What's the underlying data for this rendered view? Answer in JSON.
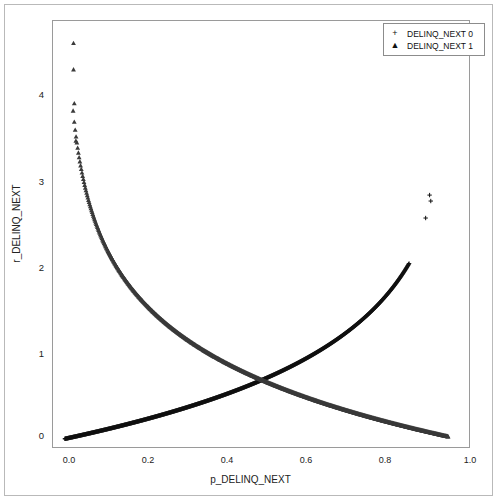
{
  "figure": {
    "background_color": "#ffffff",
    "frame_color": "#9a9a9a"
  },
  "axes": {
    "xlabel": "p_DELINQ_NEXT",
    "ylabel": "r_DELINQ_NEXT",
    "xticks": [
      "0.0",
      "0.2",
      "0.4",
      "0.6",
      "0.8",
      "1.0"
    ],
    "xtick_values": [
      0.0,
      0.2,
      0.4,
      0.6,
      0.8,
      1.0
    ],
    "yticks": [
      "0",
      "1",
      "2",
      "3",
      "4"
    ],
    "ytick_values": [
      0,
      1,
      2,
      3,
      4
    ],
    "xlim": [
      -0.03,
      1.03
    ],
    "ylim": [
      -0.12,
      4.92
    ],
    "grid": false
  },
  "legend": {
    "position": "upper-right",
    "entries": [
      {
        "marker": "+",
        "marker_name": "plus-marker",
        "label": "DELINQ_NEXT 0",
        "color": "#111111"
      },
      {
        "marker": "▲",
        "marker_name": "triangle-marker",
        "label": "DELINQ_NEXT 1",
        "color": "#333333"
      }
    ]
  },
  "chart_data": {
    "type": "scatter",
    "title": "",
    "xlabel": "p_DELINQ_NEXT",
    "ylabel": "r_DELINQ_NEXT",
    "xlim": [
      -0.03,
      1.03
    ],
    "ylim": [
      -0.12,
      4.92
    ],
    "grid": false,
    "series": [
      {
        "name": "DELINQ_NEXT 0",
        "marker": "plus",
        "color": "#111111",
        "curve": "negative-log-one-minus-p",
        "p_range": [
          0.0,
          0.873
        ],
        "n_points": 900,
        "endpoints": [
          [
            0.0,
            0.0
          ],
          [
            0.873,
            2.06
          ]
        ],
        "sample_points": [
          [
            0.0,
            0.0
          ],
          [
            0.05,
            0.051
          ],
          [
            0.1,
            0.105
          ],
          [
            0.15,
            0.163
          ],
          [
            0.2,
            0.223
          ],
          [
            0.25,
            0.288
          ],
          [
            0.3,
            0.357
          ],
          [
            0.35,
            0.431
          ],
          [
            0.4,
            0.511
          ],
          [
            0.45,
            0.598
          ],
          [
            0.5,
            0.693
          ],
          [
            0.55,
            0.799
          ],
          [
            0.6,
            0.916
          ],
          [
            0.65,
            1.05
          ],
          [
            0.7,
            1.2
          ],
          [
            0.75,
            1.39
          ],
          [
            0.8,
            1.61
          ],
          [
            0.85,
            1.9
          ],
          [
            0.873,
            2.06
          ]
        ],
        "outliers": [
          [
            0.925,
            2.87
          ],
          [
            0.928,
            2.8
          ],
          [
            0.915,
            2.6
          ]
        ]
      },
      {
        "name": "DELINQ_NEXT 1",
        "marker": "triangle",
        "color": "#3a3a3a",
        "curve": "negative-log-p",
        "p_range": [
          0.021,
          0.972
        ],
        "n_points": 900,
        "endpoints": [
          [
            0.021,
            3.3
          ],
          [
            0.972,
            0.028
          ]
        ],
        "sample_points": [
          [
            0.021,
            3.86
          ],
          [
            0.03,
            3.51
          ],
          [
            0.04,
            3.22
          ],
          [
            0.06,
            2.81
          ],
          [
            0.08,
            2.53
          ],
          [
            0.1,
            2.3
          ],
          [
            0.15,
            1.9
          ],
          [
            0.2,
            1.61
          ],
          [
            0.25,
            1.39
          ],
          [
            0.3,
            1.2
          ],
          [
            0.35,
            1.05
          ],
          [
            0.4,
            0.916
          ],
          [
            0.45,
            0.799
          ],
          [
            0.5,
            0.693
          ],
          [
            0.55,
            0.598
          ],
          [
            0.6,
            0.511
          ],
          [
            0.65,
            0.431
          ],
          [
            0.7,
            0.357
          ],
          [
            0.75,
            0.288
          ],
          [
            0.8,
            0.223
          ],
          [
            0.85,
            0.163
          ],
          [
            0.9,
            0.105
          ],
          [
            0.95,
            0.051
          ],
          [
            0.972,
            0.028
          ]
        ],
        "outliers": [
          [
            0.022,
            4.66
          ],
          [
            0.022,
            4.35
          ],
          [
            0.024,
            3.95
          ],
          [
            0.028,
            3.51
          ]
        ]
      }
    ],
    "crossing_point": [
      0.5,
      0.693
    ]
  }
}
